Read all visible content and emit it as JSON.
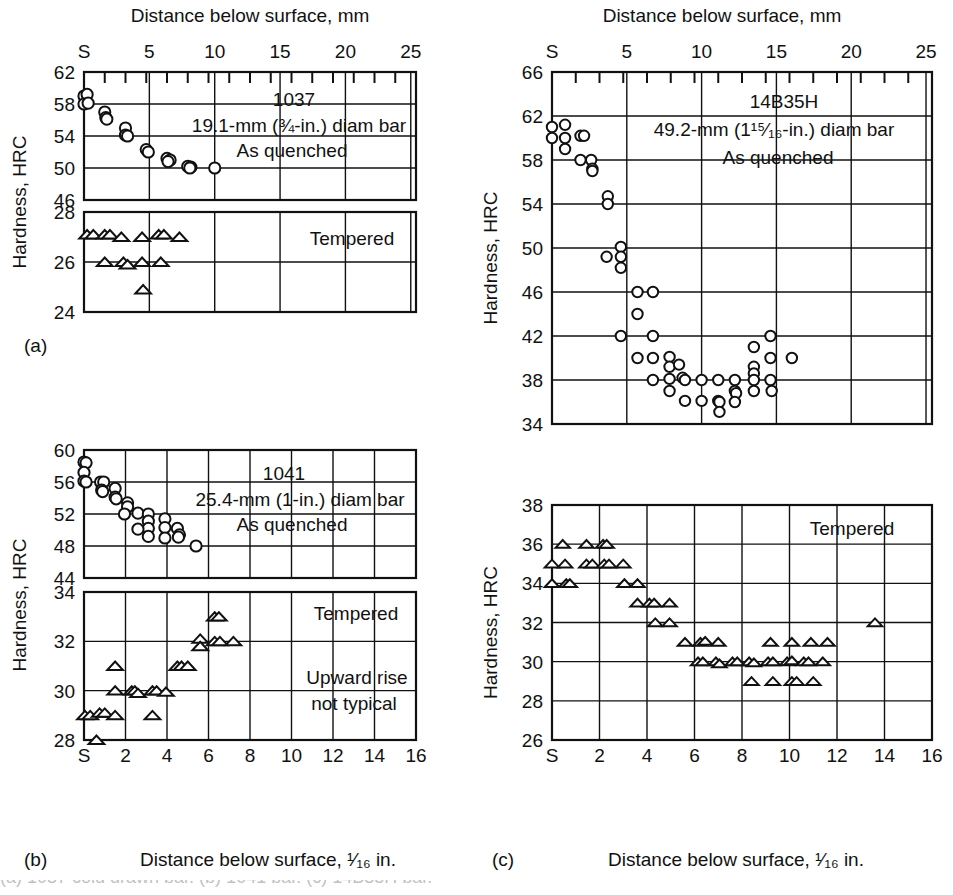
{
  "figure": {
    "top_axis_title_left": "Distance below surface, mm",
    "top_axis_title_right": "Distance below surface, mm",
    "bottom_axis_title_b": "Distance below surface, ¹⁄₁₆ in.",
    "bottom_axis_title_c": "Distance below surface, ¹⁄₁₆ in.",
    "y_axis_title": "Hardness, HRC",
    "panel_labels": {
      "a": "(a)",
      "b": "(b)",
      "c": "(c)"
    },
    "cut_caption": "(a) 1037 cold drawn bar. (b) 1041 bar. (c) 14B35H bar.",
    "line_color": "#111111",
    "marker_color": "#111111",
    "background": "#ffffff"
  },
  "mm_axis": {
    "ticks_labeled": [
      "S",
      "5",
      "10",
      "15",
      "20",
      "25"
    ],
    "label_values": [
      0,
      5,
      10,
      15,
      20,
      25
    ],
    "min": 0,
    "max": 25.4,
    "unit": "mm"
  },
  "in16_axis": {
    "ticks_labeled": [
      "S",
      "2",
      "4",
      "6",
      "8",
      "10",
      "12",
      "14",
      "16"
    ],
    "label_values": [
      0,
      2,
      4,
      6,
      8,
      10,
      12,
      14,
      16
    ],
    "min": 0,
    "max": 16,
    "unit": "1/16 in."
  },
  "chart_data": [
    {
      "id": "a-quenched",
      "type": "scatter",
      "panel": "(a)",
      "title": "1037",
      "annotations": [
        "1037",
        "19.1-mm (¾-in.) diam bar",
        "As quenched"
      ],
      "marker": "open-circle",
      "xlabel": "Distance below surface, mm",
      "ylabel": "Hardness, HRC",
      "xlim": [
        0,
        25.4
      ],
      "ylim": [
        46,
        62
      ],
      "yticks": [
        46,
        50,
        54,
        58,
        62
      ],
      "grid": true,
      "x_unit": "sixteenth-inch",
      "points": [
        {
          "x": 0.0,
          "y": 59.0
        },
        {
          "x": 0.15,
          "y": 59.2
        },
        {
          "x": 0.0,
          "y": 58.0
        },
        {
          "x": 0.2,
          "y": 58.1
        },
        {
          "x": 1.0,
          "y": 57.0
        },
        {
          "x": 1.05,
          "y": 56.3
        },
        {
          "x": 1.1,
          "y": 56.1
        },
        {
          "x": 2.0,
          "y": 55.0
        },
        {
          "x": 2.0,
          "y": 54.1
        },
        {
          "x": 2.1,
          "y": 54.0
        },
        {
          "x": 3.0,
          "y": 52.3
        },
        {
          "x": 3.1,
          "y": 52.0
        },
        {
          "x": 4.0,
          "y": 51.2
        },
        {
          "x": 4.15,
          "y": 51.0
        },
        {
          "x": 4.05,
          "y": 50.8
        },
        {
          "x": 5.0,
          "y": 50.2
        },
        {
          "x": 5.15,
          "y": 50.1
        },
        {
          "x": 5.1,
          "y": 50.0
        },
        {
          "x": 6.3,
          "y": 50.0
        }
      ]
    },
    {
      "id": "a-tempered",
      "type": "scatter",
      "panel": "(a)",
      "title": "Tempered",
      "annotations": [
        "Tempered"
      ],
      "marker": "open-triangle",
      "ylabel": "Hardness, HRC",
      "xlim": [
        0,
        25.4
      ],
      "ylim": [
        24,
        28
      ],
      "yticks": [
        24,
        26,
        28
      ],
      "grid": true,
      "x_unit": "sixteenth-inch",
      "points": [
        {
          "x": 0.15,
          "y": 27.1
        },
        {
          "x": 0.45,
          "y": 27.1
        },
        {
          "x": 1.0,
          "y": 27.1
        },
        {
          "x": 1.25,
          "y": 27.1
        },
        {
          "x": 1.0,
          "y": 26.0
        },
        {
          "x": 1.8,
          "y": 27.0
        },
        {
          "x": 1.9,
          "y": 26.0
        },
        {
          "x": 2.1,
          "y": 25.9
        },
        {
          "x": 2.8,
          "y": 27.0
        },
        {
          "x": 2.8,
          "y": 26.0
        },
        {
          "x": 2.85,
          "y": 24.9
        },
        {
          "x": 3.6,
          "y": 27.1
        },
        {
          "x": 3.85,
          "y": 27.1
        },
        {
          "x": 3.7,
          "y": 26.0
        },
        {
          "x": 4.6,
          "y": 27.0
        }
      ]
    },
    {
      "id": "b-quenched",
      "type": "scatter",
      "panel": "(b)",
      "title": "1041",
      "annotations": [
        "1041",
        "25.4-mm (1-in.) diam bar",
        "As quenched"
      ],
      "marker": "open-circle",
      "xlabel": "Distance below surface, mm",
      "ylabel": "Hardness, HRC",
      "xlim": [
        0,
        16
      ],
      "ylim": [
        44,
        60
      ],
      "yticks": [
        44,
        48,
        52,
        56,
        60
      ],
      "grid": true,
      "x_unit": "sixteenth-inch",
      "points": [
        {
          "x": 0.0,
          "y": 58.5
        },
        {
          "x": 0.1,
          "y": 58.4
        },
        {
          "x": 0.0,
          "y": 57.2
        },
        {
          "x": 0.0,
          "y": 56.1
        },
        {
          "x": 0.1,
          "y": 56.0
        },
        {
          "x": 0.8,
          "y": 56.0
        },
        {
          "x": 0.95,
          "y": 56.0
        },
        {
          "x": 0.85,
          "y": 55.0
        },
        {
          "x": 0.9,
          "y": 54.8
        },
        {
          "x": 1.5,
          "y": 55.2
        },
        {
          "x": 1.5,
          "y": 54.1
        },
        {
          "x": 1.55,
          "y": 53.9
        },
        {
          "x": 2.1,
          "y": 53.4
        },
        {
          "x": 2.1,
          "y": 52.9
        },
        {
          "x": 1.95,
          "y": 52.0
        },
        {
          "x": 2.6,
          "y": 52.1
        },
        {
          "x": 3.1,
          "y": 52.0
        },
        {
          "x": 3.1,
          "y": 51.1
        },
        {
          "x": 3.1,
          "y": 50.2
        },
        {
          "x": 3.1,
          "y": 49.2
        },
        {
          "x": 2.6,
          "y": 50.1
        },
        {
          "x": 3.9,
          "y": 51.4
        },
        {
          "x": 3.9,
          "y": 50.3
        },
        {
          "x": 3.9,
          "y": 49.0
        },
        {
          "x": 4.5,
          "y": 50.2
        },
        {
          "x": 4.6,
          "y": 49.4
        },
        {
          "x": 4.55,
          "y": 49.1
        },
        {
          "x": 5.4,
          "y": 48.0
        }
      ]
    },
    {
      "id": "b-tempered",
      "type": "scatter",
      "panel": "(b)",
      "title": "Tempered",
      "annotations": [
        "Tempered",
        "Upward rise",
        "not typical"
      ],
      "marker": "open-triangle",
      "xlabel": "Distance below surface, ¹⁄₁₆ in.",
      "ylabel": "Hardness, HRC",
      "xlim": [
        0,
        16
      ],
      "ylim": [
        28,
        34
      ],
      "yticks": [
        28,
        30,
        32,
        34
      ],
      "grid": true,
      "x_unit": "sixteenth-inch",
      "points": [
        {
          "x": 0.05,
          "y": 29.0
        },
        {
          "x": 0.3,
          "y": 29.0
        },
        {
          "x": 0.75,
          "y": 29.1
        },
        {
          "x": 1.0,
          "y": 29.1
        },
        {
          "x": 0.6,
          "y": 28.0
        },
        {
          "x": 1.5,
          "y": 29.0
        },
        {
          "x": 1.5,
          "y": 30.0
        },
        {
          "x": 1.5,
          "y": 31.0
        },
        {
          "x": 2.3,
          "y": 30.0
        },
        {
          "x": 2.45,
          "y": 30.0
        },
        {
          "x": 2.6,
          "y": 29.9
        },
        {
          "x": 3.3,
          "y": 30.0
        },
        {
          "x": 3.5,
          "y": 30.0
        },
        {
          "x": 3.3,
          "y": 29.0
        },
        {
          "x": 3.95,
          "y": 29.95
        },
        {
          "x": 4.5,
          "y": 31.0
        },
        {
          "x": 4.7,
          "y": 31.0
        },
        {
          "x": 5.0,
          "y": 31.0
        },
        {
          "x": 5.6,
          "y": 32.1
        },
        {
          "x": 5.6,
          "y": 31.8
        },
        {
          "x": 6.3,
          "y": 33.0
        },
        {
          "x": 6.5,
          "y": 33.0
        },
        {
          "x": 6.3,
          "y": 32.0
        },
        {
          "x": 6.55,
          "y": 32.0
        },
        {
          "x": 7.2,
          "y": 32.0
        }
      ]
    },
    {
      "id": "c-quenched",
      "type": "scatter",
      "panel": "(c)",
      "title": "14B35H",
      "annotations": [
        "14B35H",
        "49.2-mm (1¹⁵⁄₁₆-in.) diam bar",
        "As quenched"
      ],
      "marker": "open-circle",
      "xlabel": "Distance below surface, mm",
      "ylabel": "Hardness, HRC",
      "xlim": [
        0,
        25.4
      ],
      "ylim": [
        34,
        66
      ],
      "yticks": [
        34,
        38,
        42,
        46,
        50,
        54,
        58,
        62,
        66
      ],
      "grid": true,
      "x_unit": "sixteenth-inch",
      "points": [
        {
          "x": 0.0,
          "y": 61.0
        },
        {
          "x": 0.0,
          "y": 60.0
        },
        {
          "x": 0.55,
          "y": 61.2
        },
        {
          "x": 0.55,
          "y": 60.0
        },
        {
          "x": 0.55,
          "y": 59.0
        },
        {
          "x": 1.2,
          "y": 60.2
        },
        {
          "x": 1.35,
          "y": 60.2
        },
        {
          "x": 1.2,
          "y": 58.0
        },
        {
          "x": 1.65,
          "y": 58.0
        },
        {
          "x": 1.7,
          "y": 57.2
        },
        {
          "x": 1.7,
          "y": 57.0
        },
        {
          "x": 2.35,
          "y": 54.7
        },
        {
          "x": 2.35,
          "y": 54.0
        },
        {
          "x": 2.3,
          "y": 49.2
        },
        {
          "x": 2.9,
          "y": 50.1
        },
        {
          "x": 2.9,
          "y": 49.2
        },
        {
          "x": 2.9,
          "y": 48.2
        },
        {
          "x": 3.6,
          "y": 46.0
        },
        {
          "x": 4.25,
          "y": 46.0
        },
        {
          "x": 3.6,
          "y": 44.0
        },
        {
          "x": 2.9,
          "y": 42.0
        },
        {
          "x": 4.25,
          "y": 42.0
        },
        {
          "x": 3.6,
          "y": 40.0
        },
        {
          "x": 4.25,
          "y": 40.0
        },
        {
          "x": 4.95,
          "y": 40.1
        },
        {
          "x": 4.95,
          "y": 39.2
        },
        {
          "x": 5.35,
          "y": 39.4
        },
        {
          "x": 5.5,
          "y": 38.2
        },
        {
          "x": 4.25,
          "y": 38.0
        },
        {
          "x": 4.95,
          "y": 38.1
        },
        {
          "x": 5.6,
          "y": 38.0
        },
        {
          "x": 6.3,
          "y": 38.0
        },
        {
          "x": 7.0,
          "y": 38.0
        },
        {
          "x": 7.7,
          "y": 38.0
        },
        {
          "x": 4.95,
          "y": 37.0
        },
        {
          "x": 7.7,
          "y": 37.0
        },
        {
          "x": 7.75,
          "y": 36.8
        },
        {
          "x": 5.6,
          "y": 36.1
        },
        {
          "x": 6.3,
          "y": 36.1
        },
        {
          "x": 7.0,
          "y": 36.1
        },
        {
          "x": 7.05,
          "y": 36.0
        },
        {
          "x": 7.7,
          "y": 36.0
        },
        {
          "x": 7.05,
          "y": 35.1
        },
        {
          "x": 8.5,
          "y": 41.0
        },
        {
          "x": 8.5,
          "y": 39.2
        },
        {
          "x": 8.5,
          "y": 38.6
        },
        {
          "x": 8.5,
          "y": 38.0
        },
        {
          "x": 8.5,
          "y": 37.0
        },
        {
          "x": 9.2,
          "y": 42.0
        },
        {
          "x": 9.2,
          "y": 40.0
        },
        {
          "x": 9.2,
          "y": 38.0
        },
        {
          "x": 9.25,
          "y": 37.0
        },
        {
          "x": 10.1,
          "y": 40.0
        }
      ]
    },
    {
      "id": "c-tempered",
      "type": "scatter",
      "panel": "(c)",
      "title": "Tempered",
      "annotations": [
        "Tempered"
      ],
      "marker": "open-triangle",
      "xlabel": "Distance below surface, ¹⁄₁₆ in.",
      "ylabel": "Hardness, HRC",
      "xlim": [
        0,
        16
      ],
      "ylim": [
        26,
        38
      ],
      "yticks": [
        26,
        28,
        30,
        32,
        34,
        36,
        38
      ],
      "grid": true,
      "x_unit": "sixteenth-inch",
      "points": [
        {
          "x": 0.0,
          "y": 35.0
        },
        {
          "x": 0.0,
          "y": 34.0
        },
        {
          "x": 0.45,
          "y": 36.0
        },
        {
          "x": 0.55,
          "y": 35.0
        },
        {
          "x": 0.6,
          "y": 34.0
        },
        {
          "x": 0.75,
          "y": 34.0
        },
        {
          "x": 1.45,
          "y": 36.0
        },
        {
          "x": 1.45,
          "y": 35.0
        },
        {
          "x": 1.7,
          "y": 35.0
        },
        {
          "x": 2.15,
          "y": 36.0
        },
        {
          "x": 2.3,
          "y": 36.0
        },
        {
          "x": 2.2,
          "y": 35.0
        },
        {
          "x": 2.4,
          "y": 35.0
        },
        {
          "x": 3.0,
          "y": 35.0
        },
        {
          "x": 3.05,
          "y": 34.0
        },
        {
          "x": 3.6,
          "y": 34.0
        },
        {
          "x": 3.6,
          "y": 33.0
        },
        {
          "x": 4.1,
          "y": 33.0
        },
        {
          "x": 4.3,
          "y": 33.0
        },
        {
          "x": 4.35,
          "y": 32.0
        },
        {
          "x": 4.95,
          "y": 33.0
        },
        {
          "x": 4.95,
          "y": 32.0
        },
        {
          "x": 5.6,
          "y": 31.0
        },
        {
          "x": 6.25,
          "y": 31.0
        },
        {
          "x": 6.45,
          "y": 31.05
        },
        {
          "x": 7.0,
          "y": 31.0
        },
        {
          "x": 6.15,
          "y": 30.0
        },
        {
          "x": 6.35,
          "y": 30.0
        },
        {
          "x": 6.9,
          "y": 30.0
        },
        {
          "x": 7.05,
          "y": 29.9
        },
        {
          "x": 7.6,
          "y": 30.0
        },
        {
          "x": 7.8,
          "y": 30.0
        },
        {
          "x": 8.3,
          "y": 30.0
        },
        {
          "x": 8.5,
          "y": 29.95
        },
        {
          "x": 9.1,
          "y": 30.0
        },
        {
          "x": 9.3,
          "y": 30.0
        },
        {
          "x": 9.9,
          "y": 30.0
        },
        {
          "x": 10.1,
          "y": 30.05
        },
        {
          "x": 10.6,
          "y": 30.0
        },
        {
          "x": 10.8,
          "y": 30.0
        },
        {
          "x": 11.4,
          "y": 30.0
        },
        {
          "x": 8.4,
          "y": 29.0
        },
        {
          "x": 9.3,
          "y": 29.0
        },
        {
          "x": 10.1,
          "y": 29.0
        },
        {
          "x": 10.3,
          "y": 29.0
        },
        {
          "x": 11.0,
          "y": 29.0
        },
        {
          "x": 9.2,
          "y": 31.0
        },
        {
          "x": 10.1,
          "y": 31.0
        },
        {
          "x": 10.9,
          "y": 31.0
        },
        {
          "x": 11.6,
          "y": 31.0
        },
        {
          "x": 13.6,
          "y": 32.0
        }
      ]
    }
  ]
}
